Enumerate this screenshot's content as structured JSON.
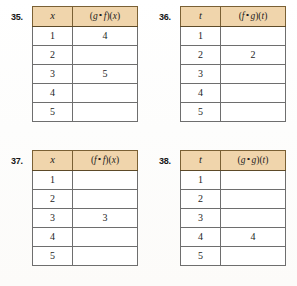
{
  "page": {
    "background_color": "#ffffff",
    "header_fill_color": "#f0d5ac",
    "border_color": "#6e6e6e",
    "header_border_color": "#7a6034"
  },
  "exercises": [
    {
      "number": "35.",
      "headers": {
        "input": "x",
        "output_prefix": "(",
        "output_left": "g",
        "output_ring": "∘",
        "output_right": "f",
        "output_mid": ")(",
        "output_arg": "x",
        "output_suffix": ")",
        "output_full": "(g ∘ f)(x)"
      },
      "rows": [
        {
          "input": "1",
          "output": "4"
        },
        {
          "input": "2",
          "output": ""
        },
        {
          "input": "3",
          "output": "5"
        },
        {
          "input": "4",
          "output": ""
        },
        {
          "input": "5",
          "output": ""
        }
      ]
    },
    {
      "number": "36.",
      "headers": {
        "input": "t",
        "output_prefix": "(",
        "output_left": "f",
        "output_ring": "∘",
        "output_right": "g",
        "output_mid": ")(",
        "output_arg": "t",
        "output_suffix": ")",
        "output_full": "(f ∘ g)(t)"
      },
      "rows": [
        {
          "input": "1",
          "output": ""
        },
        {
          "input": "2",
          "output": "2"
        },
        {
          "input": "3",
          "output": ""
        },
        {
          "input": "4",
          "output": ""
        },
        {
          "input": "5",
          "output": ""
        }
      ]
    },
    {
      "number": "37.",
      "headers": {
        "input": "x",
        "output_prefix": "(",
        "output_left": "f",
        "output_ring": "∘",
        "output_right": "f",
        "output_mid": ")(",
        "output_arg": "x",
        "output_suffix": ")",
        "output_full": "(f ∘ f)(x)"
      },
      "rows": [
        {
          "input": "1",
          "output": ""
        },
        {
          "input": "2",
          "output": ""
        },
        {
          "input": "3",
          "output": "3"
        },
        {
          "input": "4",
          "output": ""
        },
        {
          "input": "5",
          "output": ""
        }
      ]
    },
    {
      "number": "38.",
      "headers": {
        "input": "t",
        "output_prefix": "(",
        "output_left": "g",
        "output_ring": "∘",
        "output_right": "g",
        "output_mid": ")(",
        "output_arg": "t",
        "output_suffix": ")",
        "output_full": "(g ∘ g)(t)"
      },
      "rows": [
        {
          "input": "1",
          "output": ""
        },
        {
          "input": "2",
          "output": ""
        },
        {
          "input": "3",
          "output": ""
        },
        {
          "input": "4",
          "output": "4"
        },
        {
          "input": "5",
          "output": ""
        }
      ]
    }
  ]
}
